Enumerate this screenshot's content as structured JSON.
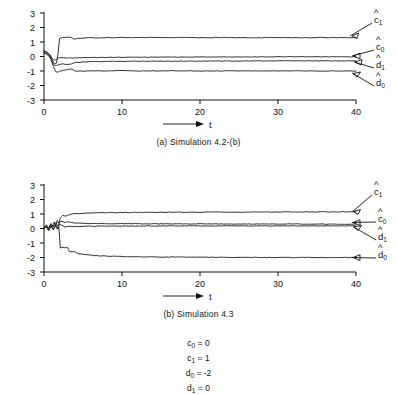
{
  "figure": {
    "background": "#ffffff",
    "ink": "#111111"
  },
  "panels": [
    {
      "id": "panel-a",
      "caption": "(a)  Simulation 4.2-(b)",
      "axis": {
        "xlabel": "t",
        "x_ticks": [
          "0",
          "10",
          "20",
          "30",
          "40"
        ],
        "y_ticks": [
          "3",
          "2",
          "1",
          "0",
          "-1",
          "-2",
          "-3"
        ]
      },
      "series_labels": [
        {
          "base": "c",
          "sub": "1",
          "hat": true
        },
        {
          "base": "c",
          "sub": "0",
          "hat": true
        },
        {
          "base": "d",
          "sub": "1",
          "hat": true
        },
        {
          "base": "d",
          "sub": "0",
          "hat": true
        }
      ]
    },
    {
      "id": "panel-b",
      "caption": "(b)  Simulation 4.3",
      "axis": {
        "xlabel": "t",
        "x_ticks": [
          "0",
          "10",
          "20",
          "30",
          "40"
        ],
        "y_ticks": [
          "3",
          "2",
          "1",
          "0",
          "-1",
          "-2",
          "-3"
        ]
      },
      "series_labels": [
        {
          "base": "c",
          "sub": "1",
          "hat": true
        },
        {
          "base": "c",
          "sub": "0",
          "hat": true
        },
        {
          "base": "d",
          "sub": "1",
          "hat": true
        },
        {
          "base": "d",
          "sub": "0",
          "hat": true
        }
      ]
    }
  ],
  "parameters": [
    {
      "name": "c",
      "sub": "0",
      "value": "0",
      "text": "c0 = 0"
    },
    {
      "name": "c",
      "sub": "1",
      "value": "1",
      "text": "c1 = 1"
    },
    {
      "name": "d",
      "sub": "0",
      "value": "-2",
      "text": "d0 = -2"
    },
    {
      "name": "d",
      "sub": "1",
      "value": "0",
      "text": "d1 = 0"
    }
  ],
  "chart_data": [
    {
      "type": "line",
      "title": "(a)  Simulation 4.2-(b)",
      "xlabel": "t",
      "ylabel": "",
      "xlim": [
        0,
        42
      ],
      "ylim": [
        -3,
        3
      ],
      "x_ticks": [
        0,
        10,
        20,
        30,
        40
      ],
      "y_ticks": [
        3,
        2,
        1,
        0,
        -1,
        -2,
        -3
      ],
      "grid": false,
      "legend": "right-annotations",
      "series": [
        {
          "name": "c1_hat",
          "label": "ĉ1",
          "final_value": 1.3,
          "x": [
            0,
            0.4,
            0.8,
            1.0,
            1.2,
            1.4,
            1.6,
            1.8,
            2.0,
            2.4,
            3.0,
            3.4,
            3.8,
            4.2,
            5.0,
            6.0,
            7.0,
            8.0,
            9.0,
            10.0,
            12.0,
            14.0,
            16.0,
            18.0,
            20.0,
            22.0,
            24.0,
            26.0,
            28.0,
            30.0,
            32.0,
            34.0,
            36.0,
            38.0,
            40.0
          ],
          "y": [
            0.35,
            0.3,
            0.1,
            -0.15,
            -0.4,
            -0.5,
            -0.45,
            0.2,
            1.25,
            1.32,
            1.33,
            1.33,
            1.2,
            1.22,
            1.28,
            1.3,
            1.28,
            1.31,
            1.29,
            1.31,
            1.3,
            1.31,
            1.29,
            1.31,
            1.3,
            1.3,
            1.31,
            1.29,
            1.3,
            1.31,
            1.3,
            1.3,
            1.31,
            1.3,
            1.3
          ]
        },
        {
          "name": "c0_hat",
          "label": "ĉ0",
          "final_value": 0.0,
          "x": [
            0,
            0.4,
            0.8,
            1.0,
            1.2,
            1.4,
            1.6,
            1.8,
            2.0,
            2.5,
            3.0,
            4.0,
            5.0,
            6.0,
            8.0,
            10.0,
            12.0,
            15.0,
            18.0,
            20.0,
            24.0,
            28.0,
            32.0,
            36.0,
            40.0
          ],
          "y": [
            0.4,
            0.3,
            0.05,
            -0.1,
            -0.2,
            -0.25,
            -0.2,
            -0.12,
            -0.08,
            -0.08,
            -0.1,
            -0.1,
            -0.08,
            -0.07,
            -0.06,
            -0.05,
            -0.05,
            -0.04,
            -0.04,
            -0.03,
            -0.03,
            -0.02,
            -0.02,
            -0.02,
            -0.02
          ]
        },
        {
          "name": "d1_hat",
          "label": "d̂1",
          "final_value": -0.3,
          "x": [
            0,
            0.4,
            0.8,
            1.0,
            1.3,
            1.6,
            1.8,
            2.0,
            2.4,
            3.0,
            3.5,
            4.0,
            5.0,
            6.0,
            8.0,
            10.0,
            14.0,
            18.0,
            22.0,
            26.0,
            30.0,
            34.0,
            38.0,
            40.0
          ],
          "y": [
            0.3,
            0.2,
            0.0,
            -0.3,
            -0.6,
            -0.62,
            -0.58,
            -0.55,
            -0.5,
            -0.55,
            -0.52,
            -0.42,
            -0.38,
            -0.36,
            -0.34,
            -0.33,
            -0.32,
            -0.32,
            -0.31,
            -0.31,
            -0.3,
            -0.3,
            -0.3,
            -0.3
          ]
        },
        {
          "name": "d0_hat",
          "label": "d̂0",
          "final_value": -1.0,
          "x": [
            0,
            0.5,
            0.9,
            1.2,
            1.5,
            1.8,
            2.0,
            2.5,
            3.0,
            3.5,
            4.0,
            5.0,
            6.0,
            8.0,
            10.0,
            12.0,
            16.0,
            20.0,
            24.0,
            28.0,
            32.0,
            36.0,
            40.0
          ],
          "y": [
            0.25,
            0.1,
            -0.2,
            -0.7,
            -1.05,
            -1.08,
            -1.02,
            -0.95,
            -0.9,
            -0.88,
            -1.0,
            -1.02,
            -0.98,
            -1.0,
            -0.97,
            -1.0,
            -0.98,
            -1.0,
            -0.99,
            -1.0,
            -0.98,
            -1.0,
            -1.0
          ]
        }
      ]
    },
    {
      "type": "line",
      "title": "(b)  Simulation 4.3",
      "xlabel": "t",
      "ylabel": "",
      "xlim": [
        0,
        42
      ],
      "ylim": [
        -3,
        3
      ],
      "x_ticks": [
        0,
        10,
        20,
        30,
        40
      ],
      "y_ticks": [
        3,
        2,
        1,
        0,
        -1,
        -2,
        -3
      ],
      "grid": false,
      "legend": "right-annotations",
      "series": [
        {
          "name": "c1_hat",
          "label": "ĉ1",
          "final_value": 1.15,
          "x": [
            0,
            0.3,
            0.6,
            0.9,
            1.1,
            1.3,
            1.5,
            1.7,
            1.9,
            2.1,
            2.4,
            2.8,
            3.2,
            3.6,
            4.0,
            5.0,
            6.0,
            8.0,
            10.0,
            14.0,
            18.0,
            22.0,
            26.0,
            30.0,
            34.0,
            38.0,
            40.0
          ],
          "y": [
            0.05,
            0.2,
            0.05,
            0.3,
            0.1,
            0.45,
            0.2,
            0.55,
            0.35,
            0.75,
            0.9,
            0.85,
            0.95,
            1.0,
            1.02,
            1.05,
            1.08,
            1.1,
            1.1,
            1.12,
            1.12,
            1.13,
            1.13,
            1.14,
            1.14,
            1.15,
            1.15
          ]
        },
        {
          "name": "c0_hat",
          "label": "ĉ0",
          "final_value": 0.3,
          "x": [
            0,
            0.3,
            0.6,
            0.9,
            1.2,
            1.5,
            1.8,
            2.0,
            2.3,
            2.7,
            3.0,
            3.5,
            4.0,
            5.0,
            6.0,
            8.0,
            12.0,
            16.0,
            20.0,
            26.0,
            32.0,
            38.0,
            40.0
          ],
          "y": [
            0.05,
            0.25,
            0.0,
            0.35,
            0.1,
            0.4,
            0.15,
            0.45,
            0.5,
            0.42,
            0.46,
            0.4,
            0.38,
            0.36,
            0.35,
            0.34,
            0.33,
            0.32,
            0.32,
            0.31,
            0.31,
            0.3,
            0.3
          ]
        },
        {
          "name": "d1_hat",
          "label": "d̂1",
          "final_value": 0.18,
          "x": [
            0,
            0.3,
            0.6,
            0.9,
            1.2,
            1.5,
            1.8,
            2.0,
            2.3,
            2.7,
            3.0,
            3.5,
            4.0,
            5.0,
            6.0,
            8.0,
            12.0,
            16.0,
            20.0,
            26.0,
            32.0,
            38.0,
            40.0
          ],
          "y": [
            0.0,
            0.15,
            -0.1,
            0.2,
            -0.05,
            0.25,
            0.0,
            0.3,
            0.22,
            0.1,
            0.15,
            0.12,
            0.14,
            0.15,
            0.16,
            0.17,
            0.17,
            0.18,
            0.18,
            0.18,
            0.18,
            0.18,
            0.18
          ]
        },
        {
          "name": "d0_hat",
          "label": "d̂0",
          "final_value": -2.0,
          "x": [
            0,
            0.3,
            0.6,
            0.9,
            1.2,
            1.5,
            1.7,
            1.9,
            2.1,
            2.3,
            2.6,
            3.0,
            3.3,
            3.6,
            4.0,
            4.5,
            5.0,
            6.0,
            7.0,
            8.0,
            10.0,
            12.0,
            16.0,
            20.0,
            26.0,
            32.0,
            38.0,
            40.0
          ],
          "y": [
            0.0,
            0.1,
            -0.15,
            0.15,
            -0.1,
            0.2,
            -0.05,
            0.1,
            -1.35,
            -1.3,
            -1.32,
            -1.3,
            -1.62,
            -1.6,
            -1.62,
            -1.75,
            -1.78,
            -1.85,
            -1.88,
            -1.9,
            -1.93,
            -1.95,
            -1.97,
            -1.98,
            -1.99,
            -2.0,
            -2.0,
            -2.0
          ]
        }
      ]
    }
  ]
}
